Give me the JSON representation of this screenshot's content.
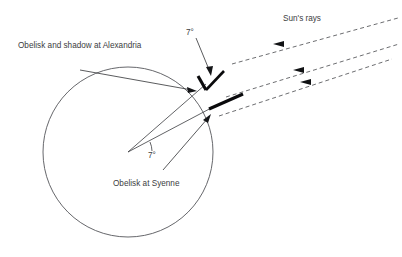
{
  "diagram": {
    "background_color": "#ffffff",
    "line_color": "#46474b",
    "mark_color": "#0a0a0c",
    "text_color": "#3c3d41",
    "labels": {
      "alexandria": "Obelisk and shadow at Alexandria",
      "syenne": "Obelisk at Syenne",
      "sun_rays": "Sun's rays",
      "angle_top": "7°",
      "angle_center": "7°"
    },
    "earth": {
      "center_x": 128,
      "center_y": 152,
      "radius": 85
    },
    "sun_rays": [
      {
        "x1": 236,
        "y1": 63,
        "x2": 396,
        "y2": 18,
        "arrow_x": 278,
        "arrow_y": 51
      },
      {
        "x1": 228,
        "y1": 97,
        "x2": 398,
        "y2": 43,
        "arrow_x": 298,
        "arrow_y": 75
      },
      {
        "x1": 222,
        "y1": 115,
        "x2": 390,
        "y2": 58,
        "arrow_x": 305,
        "arrow_y": 88
      }
    ],
    "radii": [
      {
        "label": "to Alexandria",
        "x1": 128,
        "y1": 152,
        "x2": 205,
        "y2": 86
      },
      {
        "label": "to Syenne",
        "x1": 128,
        "y1": 152,
        "x2": 213,
        "y2": 106
      }
    ],
    "obelisks": [
      {
        "name": "alexandria-obelisk",
        "x1": 198,
        "y1": 76,
        "x2": 205,
        "y2": 90
      },
      {
        "name": "alexandria-shadow",
        "x1": 205,
        "y1": 90,
        "x2": 220,
        "y2": 74
      },
      {
        "name": "syenne-obelisk",
        "x1": 210,
        "y1": 108,
        "x2": 240,
        "y2": 95
      }
    ]
  }
}
